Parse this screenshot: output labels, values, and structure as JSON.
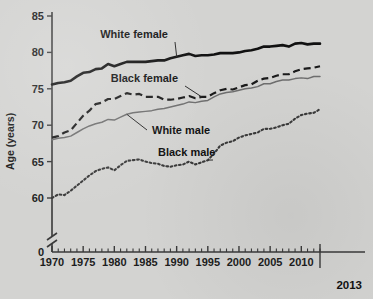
{
  "chart_data": {
    "type": "line",
    "title": "",
    "subtitle": "",
    "xlabel": "",
    "ylabel": "Age (years)",
    "xlim": [
      1970,
      2013
    ],
    "ylim": [
      57.5,
      85
    ],
    "yticks": [
      0,
      60,
      65,
      70,
      75,
      80,
      85
    ],
    "ytick_labels": [
      "0",
      "60",
      "65",
      "70",
      "75",
      "80",
      "85"
    ],
    "xticks": [
      1970,
      1975,
      1980,
      1985,
      1990,
      1995,
      2000,
      2005,
      2010
    ],
    "xtick_labels": [
      "1970",
      "1975",
      "1980",
      "1985",
      "1990",
      "1995",
      "2000",
      "2005",
      "2010"
    ],
    "x_end_label": "2013",
    "y_axis_break": true,
    "grid": false,
    "legend_position": "inline-annotations",
    "x": [
      1970,
      1971,
      1972,
      1973,
      1974,
      1975,
      1976,
      1977,
      1978,
      1979,
      1980,
      1981,
      1982,
      1983,
      1984,
      1985,
      1986,
      1987,
      1988,
      1989,
      1990,
      1991,
      1992,
      1993,
      1994,
      1995,
      1996,
      1997,
      1998,
      1999,
      2000,
      2001,
      2002,
      2003,
      2004,
      2005,
      2006,
      2007,
      2008,
      2009,
      2010,
      2011,
      2012,
      2013
    ],
    "series": [
      {
        "name": "White female",
        "style": "solid-thick-black",
        "color": "#111111",
        "values": [
          75.6,
          75.8,
          75.9,
          76.1,
          76.7,
          77.2,
          77.3,
          77.7,
          77.8,
          78.4,
          78.1,
          78.4,
          78.7,
          78.7,
          78.7,
          78.7,
          78.8,
          78.9,
          78.9,
          79.2,
          79.4,
          79.6,
          79.8,
          79.5,
          79.6,
          79.6,
          79.7,
          79.9,
          79.9,
          79.9,
          80.0,
          80.2,
          80.3,
          80.5,
          80.8,
          80.8,
          80.9,
          81.0,
          80.8,
          81.2,
          81.3,
          81.1,
          81.2,
          81.2
        ]
      },
      {
        "name": "Black female",
        "style": "dashed-black",
        "color": "#1a1a1a",
        "values": [
          68.3,
          68.5,
          69.0,
          69.3,
          70.3,
          71.3,
          72.0,
          72.9,
          73.1,
          73.6,
          73.6,
          74.0,
          74.4,
          74.2,
          74.3,
          73.9,
          73.9,
          73.9,
          73.5,
          73.5,
          73.6,
          73.8,
          74.0,
          73.7,
          73.9,
          73.9,
          74.4,
          74.8,
          75.0,
          74.9,
          75.2,
          75.5,
          75.6,
          76.1,
          76.4,
          76.5,
          76.8,
          77.0,
          77.0,
          77.4,
          77.7,
          77.8,
          77.9,
          78.1
        ]
      },
      {
        "name": "White male",
        "style": "solid-thin-gray",
        "color": "#6e6e6e",
        "values": [
          68.0,
          68.2,
          68.3,
          68.5,
          69.0,
          69.5,
          69.9,
          70.2,
          70.4,
          70.8,
          70.7,
          71.1,
          71.5,
          71.7,
          71.8,
          71.9,
          72.0,
          72.2,
          72.3,
          72.5,
          72.7,
          72.9,
          73.2,
          73.1,
          73.3,
          73.4,
          73.9,
          74.3,
          74.5,
          74.6,
          74.8,
          75.0,
          75.1,
          75.3,
          75.7,
          75.7,
          76.0,
          76.2,
          76.2,
          76.4,
          76.5,
          76.4,
          76.7,
          76.7
        ]
      },
      {
        "name": "Black male",
        "style": "dotted-black",
        "color": "#3a3a3a",
        "values": [
          60.0,
          60.5,
          60.4,
          61.0,
          61.7,
          62.4,
          63.1,
          63.7,
          64.0,
          64.2,
          63.8,
          64.5,
          65.1,
          65.2,
          65.3,
          65.0,
          64.8,
          64.7,
          64.4,
          64.3,
          64.5,
          64.6,
          65.0,
          64.6,
          64.9,
          65.2,
          66.1,
          67.2,
          67.6,
          67.8,
          68.3,
          68.6,
          68.8,
          69.0,
          69.5,
          69.5,
          69.7,
          70.0,
          70.2,
          70.9,
          71.4,
          71.6,
          71.7,
          72.2
        ]
      }
    ],
    "annotations": [
      {
        "label": "White female",
        "target_series": "White female",
        "x": 1990,
        "y": 79.4
      },
      {
        "label": "Black female",
        "target_series": "Black female",
        "x": 1994,
        "y": 73.9
      },
      {
        "label": "White male",
        "target_series": "White male",
        "x": 1982,
        "y": 71.5
      },
      {
        "label": "Black male",
        "target_series": "Black male",
        "x": 1995,
        "y": 65.2
      }
    ]
  },
  "colors": {
    "background": "#d3d3d1",
    "axis": "#3a3a3a",
    "text": "#1d1d1d",
    "white_female": "#111111",
    "black_female": "#1a1a1a",
    "white_male": "#6e6e6e",
    "black_male": "#3a3a3a"
  }
}
